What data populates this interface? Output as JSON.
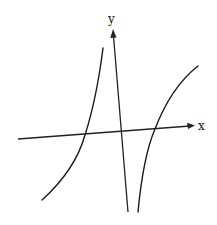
{
  "diagram": {
    "type": "function-graph-sketch",
    "axes": {
      "x_label": "x",
      "y_label": "y"
    },
    "branches": [
      {
        "name": "left-branch",
        "behavior": "increasing, crosses x-axis left of origin, rises toward asymptote"
      },
      {
        "name": "right-branch",
        "behavior": "increasing from below, crosses x-axis right of origin, concave down"
      }
    ],
    "colors": {
      "ink": "#1a1a1a",
      "background": "#ffffff"
    }
  }
}
